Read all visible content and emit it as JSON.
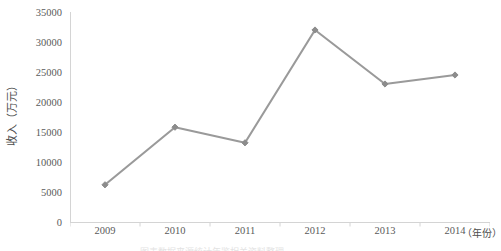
{
  "chart_data": {
    "type": "line",
    "title": "",
    "xlabel": "（年份）",
    "ylabel": "收入（万元）",
    "categories": [
      "2009",
      "2010",
      "2011",
      "2012",
      "2013",
      "2014"
    ],
    "values": [
      6200,
      15800,
      13200,
      32000,
      23000,
      24500
    ],
    "series": [
      {
        "name": "收入",
        "values": [
          6200,
          15800,
          13200,
          32000,
          23000,
          24500
        ]
      }
    ],
    "ylim": [
      0,
      35000
    ],
    "ytick_labels": [
      "0",
      "5000",
      "10000",
      "15000",
      "20000",
      "25000",
      "30000",
      "35000"
    ],
    "ytick_values": [
      0,
      5000,
      10000,
      15000,
      20000,
      25000,
      30000,
      35000
    ],
    "xtick_labels": [
      "2009",
      "2010",
      "2011",
      "2012",
      "2013",
      "2014"
    ],
    "grid": false,
    "legend": false,
    "legend_position": "none",
    "marker": "diamond",
    "line_color": "#9a9a9a",
    "marker_color": "#8c8c8c",
    "axis_color": "#d4d4d4",
    "tick_label_color": "#5a5a5a"
  },
  "axis": {
    "y_title": "收入（万元）",
    "x_title": "（年份）"
  },
  "caption": {
    "bottom_strip": "图表数据来源统计年鉴相关资料整理"
  }
}
